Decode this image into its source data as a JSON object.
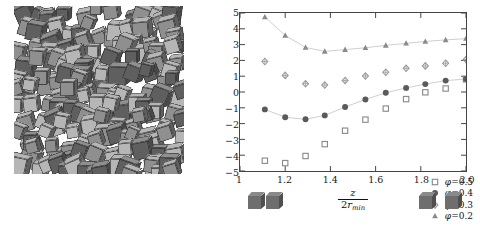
{
  "figure": {
    "left_panel": {
      "name": "cube-packing-snapshot",
      "description": "Simulation snapshot of densely packed grey cubes",
      "cube_count": 150,
      "colors": {
        "light": "#b6b6b6",
        "mid": "#8f8f8f",
        "dark": "#5f5f5f",
        "edge": "#3a3a3a"
      }
    }
  },
  "chart_data": {
    "type": "scatter",
    "title": "",
    "xlabel_num": "z",
    "xlabel_den_r": "r",
    "xlabel_den_sub": "min",
    "xlabel_den_pre": "2",
    "ylabel_F": "F",
    "ylabel_F_sub": "12",
    "ylabel_args": "(x",
    "ylabel_xsub": "min",
    "ylabel_mid": ", y",
    "ylabel_ysub": "min",
    "ylabel_z": ", z)/(k",
    "ylabel_ksub": "B",
    "ylabel_end": "T)",
    "xlim": [
      1.0,
      2.0
    ],
    "ylim": [
      -5,
      5
    ],
    "xticks": [
      1,
      1.2,
      1.4,
      1.6,
      1.8,
      2.0
    ],
    "xtick_labels": [
      "1",
      "1.2",
      "1.4",
      "1.6",
      "1.8",
      "2.0"
    ],
    "yticks": [
      -5,
      -4,
      -3,
      -2,
      -1,
      0,
      1,
      2,
      3,
      4,
      5
    ],
    "ytick_labels": [
      "−5",
      "−4",
      "−3",
      "−2",
      "−1",
      "0",
      "1",
      "2",
      "3",
      "4",
      "5"
    ],
    "grid": false,
    "legend_position": "bottom-right",
    "series": [
      {
        "name": "phi-0.5",
        "label_phi": "φ",
        "label_eq": "=",
        "label_val": "0.5",
        "marker": "open-square",
        "color": "#8b8b8b",
        "has_line": false,
        "x": [
          1.11,
          1.2,
          1.29,
          1.375,
          1.465,
          1.555,
          1.645,
          1.735,
          1.82,
          1.91,
          2.0
        ],
        "y": [
          -4.35,
          -4.5,
          -4.05,
          -3.3,
          -2.45,
          -1.75,
          -1.05,
          -0.45,
          -0.02,
          0.22,
          0.8
        ]
      },
      {
        "name": "phi-0.4",
        "label_phi": "φ",
        "label_eq": "=",
        "label_val": "0.4",
        "marker": "filled-circle",
        "color": "#5a5a5a",
        "has_line": true,
        "x": [
          1.11,
          1.2,
          1.29,
          1.375,
          1.465,
          1.555,
          1.645,
          1.735,
          1.82,
          1.91,
          2.0
        ],
        "y": [
          -1.1,
          -1.6,
          -1.73,
          -1.48,
          -0.95,
          -0.47,
          -0.05,
          0.26,
          0.5,
          0.72,
          0.82
        ]
      },
      {
        "name": "phi-0.3",
        "label_phi": "φ",
        "label_eq": "=",
        "label_val": "0.3",
        "marker": "open-diamond",
        "color": "#9a9a9a",
        "has_line": false,
        "x": [
          1.11,
          1.2,
          1.29,
          1.375,
          1.465,
          1.555,
          1.645,
          1.735,
          1.82,
          1.91,
          2.0
        ],
        "y": [
          1.93,
          1.05,
          0.52,
          0.44,
          0.73,
          1.01,
          1.25,
          1.5,
          1.65,
          1.82,
          2.05
        ]
      },
      {
        "name": "phi-0.2",
        "label_phi": "φ",
        "label_eq": "=",
        "label_val": "0.2",
        "marker": "triangle-up",
        "color": "#8a8a8a",
        "has_line": true,
        "x": [
          1.11,
          1.2,
          1.29,
          1.375,
          1.465,
          1.555,
          1.645,
          1.735,
          1.82,
          1.91,
          2.0
        ],
        "y": [
          4.75,
          3.58,
          2.82,
          2.57,
          2.68,
          2.8,
          2.95,
          3.08,
          3.2,
          3.3,
          3.38
        ]
      }
    ],
    "axis_pictograms": [
      {
        "name": "cubes-touching",
        "x_center": 1.115,
        "separated": false
      },
      {
        "name": "cubes-separated",
        "x_center": 1.885,
        "separated": true
      }
    ]
  }
}
